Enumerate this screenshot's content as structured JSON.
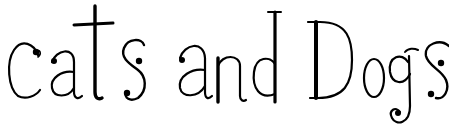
{
  "logo": {
    "text": "cats and Dogs",
    "words": [
      "cats",
      "and",
      "Dogs"
    ],
    "ink_color": "#000000",
    "background": "#ffffff"
  }
}
